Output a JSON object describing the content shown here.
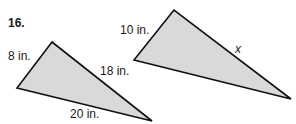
{
  "problem_number": "16.",
  "triangles": [
    {
      "name": "left-triangle",
      "vertices": [
        [
          52,
          42
        ],
        [
          17,
          88
        ],
        [
          152,
          121
        ]
      ],
      "side_labels": {
        "short": "8 in.",
        "middle": "18 in.",
        "long": "20 in."
      }
    },
    {
      "name": "right-triangle",
      "vertices": [
        [
          174,
          10
        ],
        [
          134,
          60
        ],
        [
          291,
          99
        ]
      ],
      "side_labels": {
        "short": "10 in.",
        "middle": "x"
      }
    }
  ],
  "colors": {
    "fill": "#d9d9d9",
    "stroke": "#111111",
    "text": "#1a1a1a"
  }
}
